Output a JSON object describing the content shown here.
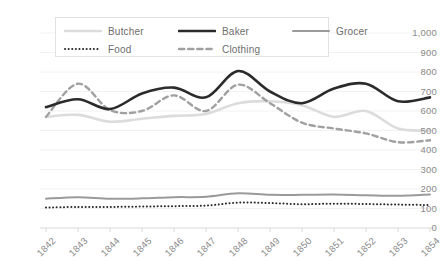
{
  "chart_data": {
    "type": "line",
    "title": "",
    "subtitle": "",
    "xlabel": "",
    "ylabel": "",
    "grid": true,
    "legend_position": "top-left-inside",
    "categories": [
      "1842",
      "1843",
      "1844",
      "1845",
      "1846",
      "1847",
      "1848",
      "1849",
      "1850",
      "1851",
      "1852",
      "1853",
      "1854"
    ],
    "x": [
      1842,
      1843,
      1844,
      1845,
      1846,
      1847,
      1848,
      1849,
      1850,
      1851,
      1852,
      1853,
      1854
    ],
    "ylim": [
      0,
      1000
    ],
    "yticks": [
      0,
      100,
      200,
      300,
      400,
      500,
      600,
      700,
      800,
      900,
      1000
    ],
    "ytick_labels": [
      "0",
      "100",
      "200",
      "300",
      "400",
      "500",
      "600",
      "700",
      "800",
      "900",
      "1,000"
    ],
    "series": [
      {
        "name": "Butcher",
        "color": "#dcdcdc",
        "style": "solid",
        "width": 2.6,
        "values": [
          570,
          580,
          545,
          560,
          575,
          585,
          640,
          650,
          630,
          570,
          600,
          510,
          500
        ]
      },
      {
        "name": "Baker",
        "color": "#2b2b2b",
        "style": "solid",
        "width": 2.6,
        "values": [
          620,
          660,
          610,
          690,
          720,
          670,
          805,
          700,
          640,
          715,
          740,
          650,
          670
        ]
      },
      {
        "name": "Grocer",
        "color": "#9a9a9a",
        "style": "solid",
        "width": 2.0,
        "values": [
          150,
          158,
          150,
          152,
          158,
          160,
          178,
          170,
          170,
          172,
          168,
          165,
          172
        ]
      },
      {
        "name": "Food",
        "color": "#2b2b2b",
        "style": "dotted",
        "width": 2.0,
        "values": [
          105,
          108,
          108,
          110,
          112,
          115,
          130,
          128,
          122,
          125,
          123,
          120,
          118
        ]
      },
      {
        "name": "Clothing",
        "color": "#a0a0a0",
        "style": "dashed",
        "width": 2.4,
        "values": [
          570,
          740,
          605,
          600,
          680,
          600,
          735,
          640,
          540,
          510,
          485,
          440,
          450
        ]
      }
    ]
  },
  "legend": {
    "items": [
      {
        "label": "Butcher",
        "series": "Butcher"
      },
      {
        "label": "Baker",
        "series": "Baker"
      },
      {
        "label": "Grocer",
        "series": "Grocer"
      },
      {
        "label": "Food",
        "series": "Food"
      },
      {
        "label": "Clothing",
        "series": "Clothing"
      }
    ]
  },
  "colors": {
    "axis_text": "#8a8a8a",
    "gridline": "#f2f2f2",
    "axis_line": "#d9d9d9",
    "legend_border": "#e2e2e2",
    "background": "#ffffff"
  }
}
